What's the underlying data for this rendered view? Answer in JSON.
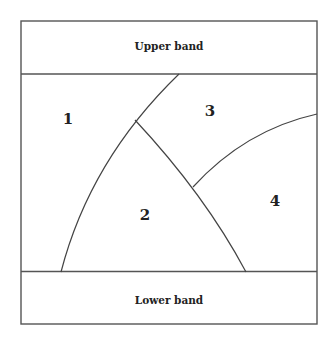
{
  "diagram": {
    "upper_band": {
      "label": "Upper band"
    },
    "lower_band": {
      "label": "Lower band"
    },
    "regions": [
      {
        "id": "1",
        "label": "1"
      },
      {
        "id": "2",
        "label": "2"
      },
      {
        "id": "3",
        "label": "3"
      },
      {
        "id": "4",
        "label": "4"
      }
    ],
    "colors": {
      "line": "#555555",
      "text": "#222222",
      "background": "#ffffff"
    }
  }
}
